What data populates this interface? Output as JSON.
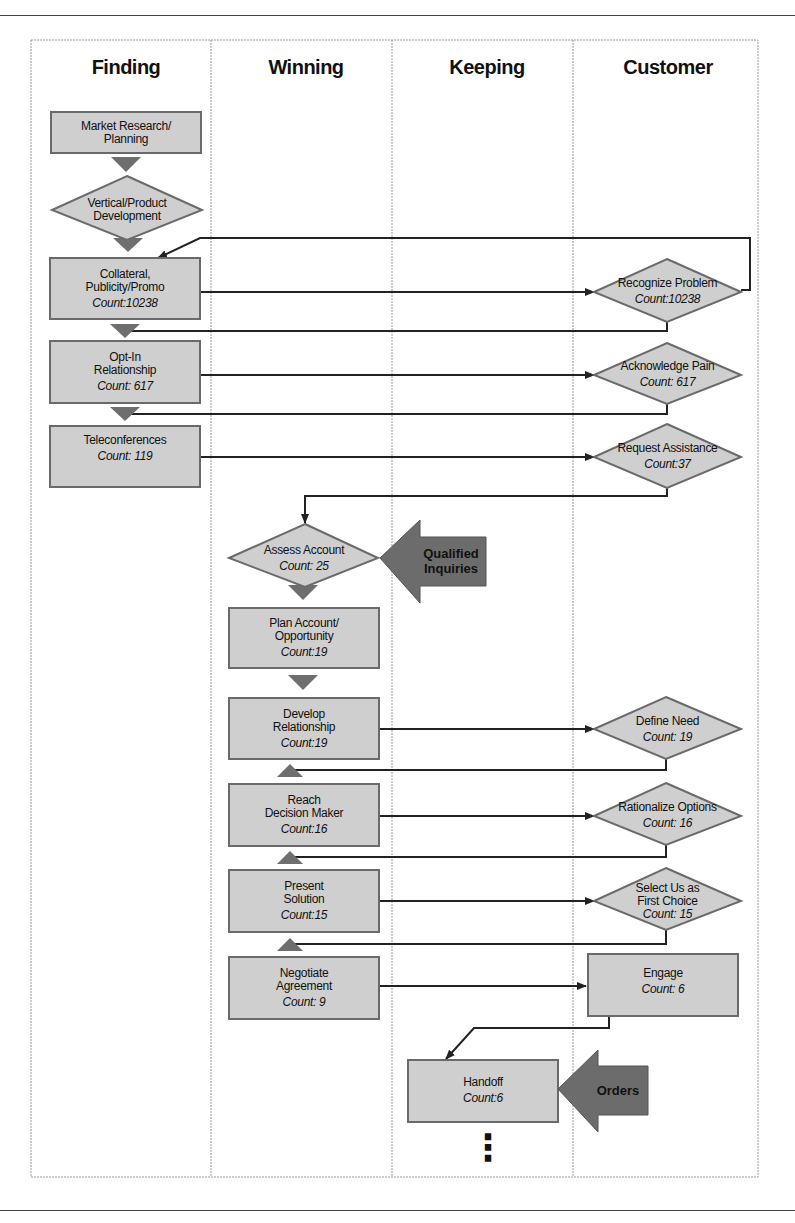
{
  "lanes": [
    {
      "title": "Finding"
    },
    {
      "title": "Winning"
    },
    {
      "title": "Keeping"
    },
    {
      "title": "Customer"
    }
  ],
  "nodes": {
    "market_research": {
      "label": "Market Research/ Planning",
      "line1": "Market Research/",
      "line2": "Planning",
      "count": ""
    },
    "vertical_product": {
      "line1": "Vertical/Product",
      "line2": "Development",
      "count": ""
    },
    "collateral": {
      "line1": "Collateral,",
      "line2": "Publicity/Promo",
      "count": "Count:10238"
    },
    "opt_in": {
      "line1": "Opt-In",
      "line2": "Relationship",
      "count": "Count: 617"
    },
    "teleconferences": {
      "line1": "Teleconferences",
      "count": "Count: 119"
    },
    "recognize_problem": {
      "line1": "Recognize Problem",
      "count": "Count:10238"
    },
    "acknowledge_pain": {
      "line1": "Acknowledge Pain",
      "count": "Count: 617"
    },
    "request_assistance": {
      "line1": "Request Assistance",
      "count": "Count:37"
    },
    "assess_account": {
      "line1": "Assess Account",
      "count": "Count: 25"
    },
    "plan_account": {
      "line1": "Plan Account/",
      "line2": "Opportunity",
      "count": "Count:19"
    },
    "develop_relationship": {
      "line1": "Develop",
      "line2": "Relationship",
      "count": "Count:19"
    },
    "define_need": {
      "line1": "Define Need",
      "count": "Count: 19"
    },
    "reach_decision_maker": {
      "line1": "Reach",
      "line2": "Decision Maker",
      "count": "Count:16"
    },
    "rationalize_options": {
      "line1": "Rationalize Options",
      "count": "Count: 16"
    },
    "present_solution": {
      "line1": "Present",
      "line2": "Solution",
      "count": "Count:15"
    },
    "select_us": {
      "line1": "Select Us as",
      "line2": "First Choice",
      "count": "Count: 15"
    },
    "negotiate_agreement": {
      "line1": "Negotiate",
      "line2": "Agreement",
      "count": "Count: 9"
    },
    "engage": {
      "line1": "Engage",
      "count": "Count: 6"
    },
    "handoff": {
      "line1": "Handoff",
      "count": "Count:6"
    }
  },
  "callouts": {
    "qualified_inquiries": {
      "line1": "Qualified",
      "line2": "Inquiries"
    },
    "orders": {
      "line1": "Orders"
    }
  },
  "continuation": "⋮",
  "colors": {
    "node_fill": "#cfcfcf",
    "node_stroke": "#6a6a6a",
    "connector_triangle": "#6e6e6e",
    "callout_fill": "#6c6c6c",
    "line": "#222222",
    "lane_border": "#9a9a9a"
  }
}
